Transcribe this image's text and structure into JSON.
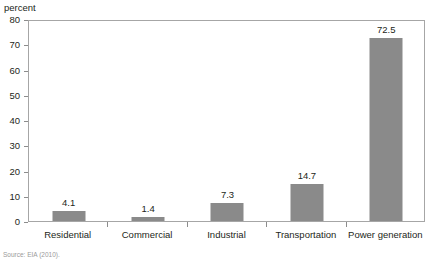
{
  "chart_data": {
    "type": "bar",
    "title": "",
    "xlabel": "",
    "ylabel": "percent",
    "categories": [
      "Residential",
      "Commercial",
      "Industrial",
      "Transportation",
      "Power generation"
    ],
    "values": [
      4.1,
      1.4,
      7.3,
      14.7,
      72.5
    ],
    "value_labels": [
      "4.1",
      "1.4",
      "7.3",
      "14.7",
      "72.5"
    ],
    "ylim": [
      0,
      80
    ],
    "ytick_step": 10,
    "yticks": [
      0,
      10,
      20,
      30,
      40,
      50,
      60,
      70,
      80
    ],
    "ytick_labels": [
      "0",
      "10",
      "20",
      "30",
      "40",
      "50",
      "60",
      "70",
      "80"
    ],
    "grid": false,
    "legend": false,
    "legend_position": "none",
    "bar_color": "#8a8a8a",
    "frame_color": "#a6a6a6",
    "text_color": "#231f20"
  },
  "axis": {
    "unit_caption": "percent"
  },
  "source": {
    "note": "Source: EIA (2010)."
  }
}
